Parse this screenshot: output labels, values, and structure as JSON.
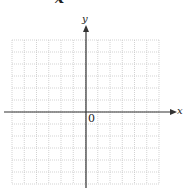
{
  "heading": {
    "text": "x"
  },
  "axes": {
    "x_label": "x",
    "y_label": "y",
    "origin_label": "0"
  },
  "grid": {
    "columns": 12,
    "rows": 12,
    "line_color": "#c8c8c8",
    "axis_color": "#333333"
  },
  "chart_data": {
    "type": "scatter",
    "title": "",
    "xlabel": "x",
    "ylabel": "y",
    "xlim": [
      -6,
      6
    ],
    "ylim": [
      -6,
      6
    ],
    "grid": true,
    "series": [],
    "annotations": [
      "0"
    ]
  }
}
